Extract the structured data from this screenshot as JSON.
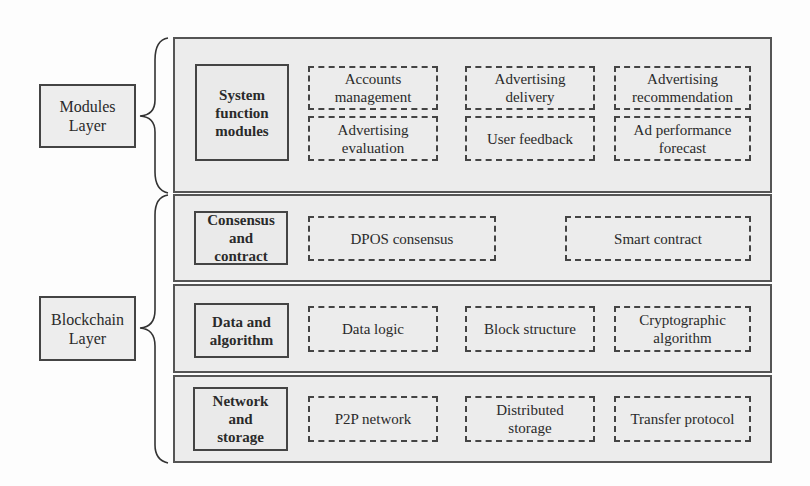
{
  "layers": {
    "modules": {
      "label": "Modules\nLayer"
    },
    "blockchain": {
      "label": "Blockchain\nLayer"
    }
  },
  "rows": [
    {
      "title": "System\nfunction\nmodules",
      "items": [
        "Accounts\nmanagement",
        "Advertising\ndelivery",
        "Advertising\nrecommendation",
        "Advertising\nevaluation",
        "User feedback",
        "Ad performance\nforecast"
      ]
    },
    {
      "title": "Consensus\nand\ncontract",
      "items": [
        "DPOS consensus",
        "Smart contract"
      ]
    },
    {
      "title": "Data and\nalgorithm",
      "items": [
        "Data logic",
        "Block structure",
        "Cryptographic\nalgorithm"
      ]
    },
    {
      "title": "Network\nand\nstorage",
      "items": [
        "P2P network",
        "Distributed\nstorage",
        "Transfer protocol"
      ]
    }
  ]
}
